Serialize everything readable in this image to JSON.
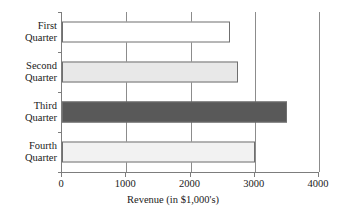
{
  "chart_data": {
    "type": "bar",
    "orientation": "horizontal",
    "title": "",
    "xlabel": "Revenue (in $1,000's)",
    "ylabel": "",
    "categories": [
      "First Quarter",
      "Second Quarter",
      "Third Quarter",
      "Fourth Quarter"
    ],
    "category_lines": [
      [
        "First",
        "Quarter"
      ],
      [
        "Second",
        "Quarter"
      ],
      [
        "Third",
        "Quarter"
      ],
      [
        "Fourth",
        "Quarter"
      ]
    ],
    "values": [
      2620,
      2740,
      3500,
      3000
    ],
    "bar_colors": [
      "#ffffff",
      "#e8e8e8",
      "#595959",
      "#f2f2f2"
    ],
    "bar_border_color": "#6f6f6f",
    "xlim": [
      0,
      4000
    ],
    "xticks": [
      0,
      1000,
      2000,
      3000,
      4000
    ],
    "xtick_labels": [
      "0",
      "1000",
      "2000",
      "3000",
      "4000"
    ],
    "grid": "vertical",
    "gridline_color": "#8c8c8c",
    "axis_color": "#7d7d7d",
    "legend": "none"
  }
}
